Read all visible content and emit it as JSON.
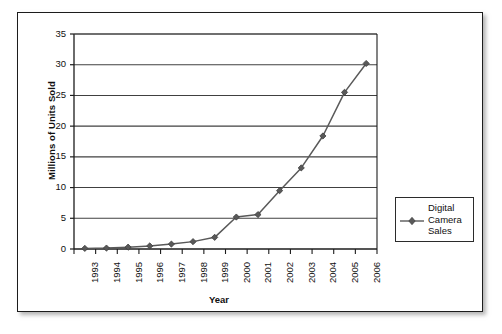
{
  "chart_data": {
    "type": "line",
    "title": "",
    "xlabel": "Year",
    "ylabel": "Millions of Units Sold",
    "categories": [
      "1993",
      "1994",
      "1995",
      "1996",
      "1997",
      "1998",
      "1999",
      "2000",
      "2001",
      "2002",
      "2003",
      "2004",
      "2005",
      "2006"
    ],
    "series": [
      {
        "name": "Digital Camera Sales",
        "values": [
          0.1,
          0.15,
          0.3,
          0.5,
          0.8,
          1.2,
          1.9,
          5.2,
          5.6,
          9.5,
          13.2,
          18.4,
          25.5,
          30.2
        ]
      }
    ],
    "ylim": [
      0,
      35
    ],
    "y_ticks": [
      "0",
      "5",
      "10",
      "15",
      "20",
      "25",
      "30",
      "35"
    ],
    "grid": "horizontal",
    "legend_position": "right",
    "marker": "diamond",
    "series_color": "#595959",
    "axis_color": "#1c1c1c",
    "gridline_color": "#404040"
  },
  "legend": {
    "entries": [
      {
        "label": "Digital Camera Sales",
        "marker_icon": "line-diamond-marker"
      }
    ]
  },
  "axes": {
    "y_title": "Millions of Units Sold",
    "x_title": "Year"
  }
}
